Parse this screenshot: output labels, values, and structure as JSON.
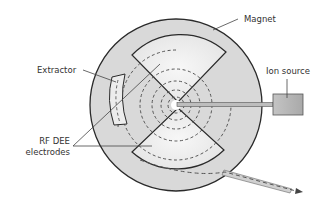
{
  "diagram": {
    "labels": {
      "magnet": "Magnet",
      "extractor": "Extractor",
      "ion_source": "Ion source",
      "rf_dee_line1": "RF DEE",
      "rf_dee_line2": "electrodes"
    },
    "colors": {
      "magnet_fill": "#d9d9d9",
      "dee_fill": "#efefef",
      "outline": "#2a2a2a",
      "orbit_dash": "#555555",
      "ion_source_fill": "#b5b5b5",
      "leader_line": "#444444"
    }
  }
}
